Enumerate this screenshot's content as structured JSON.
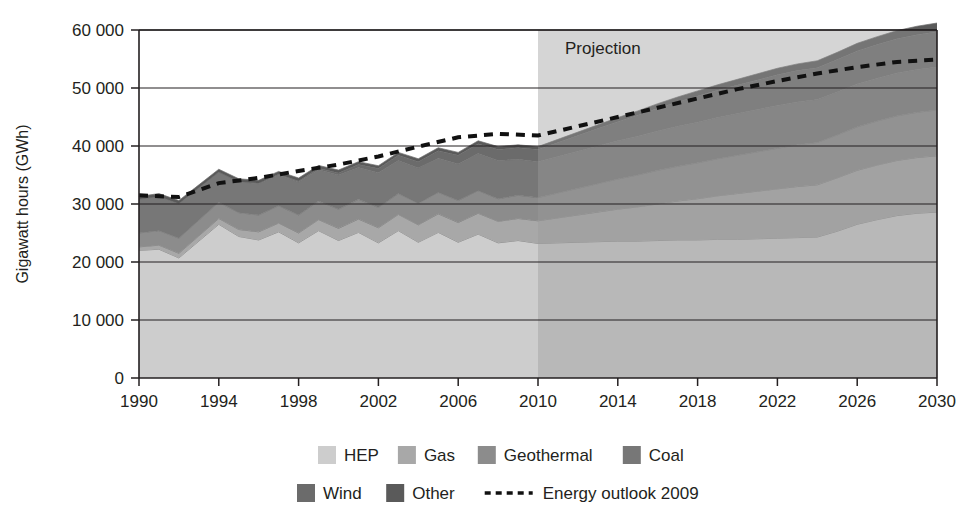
{
  "chart_data": {
    "type": "area",
    "title": "",
    "xlabel": "",
    "ylabel": "Gigawatt hours (GWh)",
    "stacked": true,
    "grid": true,
    "legend_position": "bottom",
    "xlim": [
      1990,
      2030
    ],
    "ylim": [
      0,
      60000
    ],
    "y_ticks": [
      0,
      10000,
      20000,
      30000,
      40000,
      50000,
      60000
    ],
    "y_tick_labels": [
      "0",
      "10 000",
      "20 000",
      "30 000",
      "40 000",
      "50 000",
      "60 000"
    ],
    "x_ticks": [
      1990,
      1994,
      1998,
      2002,
      2006,
      2010,
      2014,
      2018,
      2022,
      2026,
      2030
    ],
    "x_tick_labels": [
      "1990",
      "1994",
      "1998",
      "2002",
      "2006",
      "2010",
      "2014",
      "2018",
      "2022",
      "2026",
      "2030"
    ],
    "x": [
      1990,
      1991,
      1992,
      1993,
      1994,
      1995,
      1996,
      1997,
      1998,
      1999,
      2000,
      2001,
      2002,
      2003,
      2004,
      2005,
      2006,
      2007,
      2008,
      2009,
      2010,
      2011,
      2012,
      2013,
      2014,
      2015,
      2016,
      2017,
      2018,
      2019,
      2020,
      2021,
      2022,
      2023,
      2024,
      2025,
      2026,
      2027,
      2028,
      2029,
      2030
    ],
    "series": [
      {
        "name": "HEP",
        "color": "#cdcdcd",
        "values": [
          22000,
          22200,
          20700,
          23600,
          26500,
          24400,
          23800,
          25200,
          23300,
          25400,
          23700,
          25100,
          23300,
          25400,
          23400,
          25100,
          23400,
          24800,
          23300,
          23700,
          23200,
          23300,
          23400,
          23500,
          23600,
          23600,
          23700,
          23800,
          23800,
          23900,
          23900,
          24000,
          24100,
          24200,
          24300,
          25300,
          26500,
          27300,
          28000,
          28400,
          28600
        ]
      },
      {
        "name": "Gas",
        "color": "#a8a8a8",
        "values": [
          600,
          700,
          800,
          900,
          1000,
          1200,
          1400,
          1500,
          1700,
          1900,
          2100,
          2300,
          2600,
          2800,
          3000,
          3200,
          3400,
          3600,
          3700,
          3800,
          3900,
          4300,
          4700,
          5100,
          5500,
          5900,
          6300,
          6700,
          7100,
          7500,
          7900,
          8200,
          8500,
          8800,
          9000,
          9200,
          9300,
          9400,
          9500,
          9600,
          9700
        ]
      },
      {
        "name": "Geothermal",
        "color": "#8c8c8c",
        "values": [
          2400,
          2500,
          2600,
          2700,
          2800,
          2900,
          2900,
          3000,
          3100,
          3200,
          3300,
          3400,
          3500,
          3600,
          3700,
          3700,
          3800,
          3900,
          3900,
          4000,
          4000,
          4300,
          4600,
          4900,
          5200,
          5500,
          5800,
          6000,
          6200,
          6400,
          6600,
          6800,
          7000,
          7200,
          7300,
          7400,
          7500,
          7600,
          7700,
          7800,
          7900
        ]
      },
      {
        "name": "Coal",
        "color": "#777777",
        "values": [
          5800,
          5900,
          6000,
          5600,
          5200,
          5300,
          5400,
          5300,
          5700,
          5400,
          5900,
          5500,
          6000,
          5700,
          6100,
          5900,
          6300,
          6400,
          6600,
          6200,
          6200,
          6300,
          6400,
          6500,
          6600,
          6700,
          6800,
          6900,
          7000,
          7100,
          7200,
          7300,
          7400,
          7400,
          7400,
          7400,
          7400,
          7400,
          7400,
          7400,
          7400
        ]
      },
      {
        "name": "Wind",
        "color": "#6b6b6b",
        "values": [
          0,
          0,
          0,
          0,
          0,
          50,
          80,
          120,
          180,
          250,
          350,
          500,
          700,
          900,
          1100,
          1300,
          1500,
          1700,
          1900,
          2000,
          2100,
          2400,
          2700,
          3000,
          3300,
          3600,
          3900,
          4200,
          4500,
          4700,
          4900,
          5100,
          5300,
          5400,
          5500,
          5600,
          5700,
          5800,
          5900,
          6000,
          6100
        ]
      },
      {
        "name": "Other",
        "color": "#5a5a5a",
        "values": [
          500,
          500,
          500,
          500,
          500,
          500,
          500,
          500,
          500,
          500,
          500,
          500,
          500,
          500,
          500,
          500,
          500,
          500,
          500,
          500,
          500,
          550,
          600,
          650,
          700,
          750,
          800,
          850,
          900,
          950,
          1000,
          1050,
          1100,
          1150,
          1200,
          1250,
          1300,
          1350,
          1400,
          1450,
          1500
        ]
      }
    ],
    "totals": [
      31300,
      31800,
      30600,
      33300,
      36000,
      34350,
      34080,
      35620,
      34480,
      36150,
      35850,
      37300,
      36600,
      38400,
      37800,
      39200,
      38900,
      40400,
      39900,
      40200,
      39900,
      41150,
      42400,
      43650,
      44900,
      46050,
      47300,
      48450,
      49500,
      50550,
      51500,
      52450,
      53400,
      54150,
      54700,
      56150,
      57700,
      58850,
      59900,
      60650,
      61300
    ]
  },
  "overlay": {
    "projection_label": "Projection",
    "projection_start_year": 2010,
    "projection_shade_color": "#9a9a9a"
  },
  "outlook": {
    "name": "Energy outlook 2009",
    "color": "#111111",
    "style": "dashed",
    "x": [
      1990,
      1992,
      1994,
      1996,
      1998,
      2000,
      2002,
      2004,
      2006,
      2008,
      2010,
      2012,
      2014,
      2016,
      2018,
      2020,
      2022,
      2024,
      2026,
      2028,
      2030
    ],
    "values": [
      31500,
      31200,
      33600,
      34500,
      35700,
      36800,
      38200,
      39900,
      41500,
      42100,
      41800,
      43400,
      45000,
      46600,
      48200,
      49800,
      51200,
      52500,
      53600,
      54500,
      54900
    ]
  },
  "legend": {
    "row1": [
      {
        "label": "HEP",
        "color": "#cdcdcd",
        "swatch": "square"
      },
      {
        "label": "Gas",
        "color": "#a8a8a8",
        "swatch": "square"
      },
      {
        "label": "Geothermal",
        "color": "#8c8c8c",
        "swatch": "square"
      },
      {
        "label": "Coal",
        "color": "#777777",
        "swatch": "square"
      }
    ],
    "row2": [
      {
        "label": "Wind",
        "color": "#6b6b6b",
        "swatch": "square"
      },
      {
        "label": "Other",
        "color": "#5a5a5a",
        "swatch": "square"
      },
      {
        "label": "Energy outlook 2009",
        "color": "#111111",
        "swatch": "dashed-line"
      }
    ]
  }
}
